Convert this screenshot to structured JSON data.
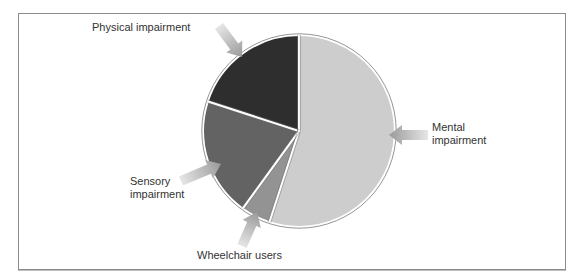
{
  "chart_data": {
    "type": "pie",
    "title": "",
    "categories": [
      "Mental impairment",
      "Wheelchair users",
      "Sensory impairment",
      "Physical impairment"
    ],
    "values": [
      55,
      5,
      20,
      20
    ],
    "units": "percent (estimated from slice angles)",
    "colors": [
      "#cdcdcd",
      "#939393",
      "#636363",
      "#2e2e2e"
    ],
    "start_angle_deg": 0,
    "direction": "clockwise",
    "legend": "none (arrow callout labels)"
  },
  "labels": {
    "physical": "Physical impairment",
    "mental_line1": "Mental",
    "mental_line2": "impairment",
    "sensory_line1": "Sensory",
    "sensory_line2": "impairment",
    "wheelchair": "Wheelchair users"
  }
}
